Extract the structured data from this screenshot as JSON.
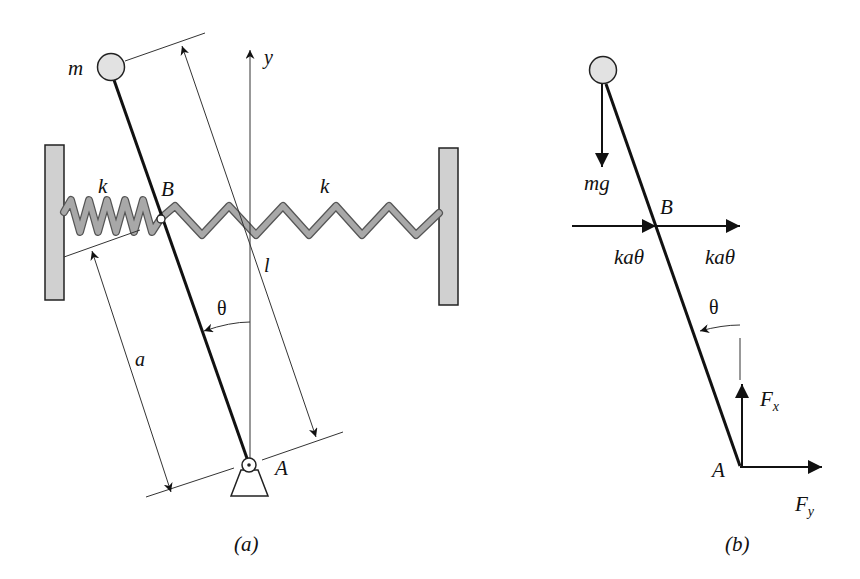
{
  "figure": {
    "panels": [
      {
        "id": "a",
        "caption": "(a)",
        "labels": {
          "mass": "m",
          "y_axis": "y",
          "spring_left": "k",
          "spring_right": "k",
          "point_B": "B",
          "point_A": "A",
          "length_l": "l",
          "length_a": "a",
          "angle": "θ"
        }
      },
      {
        "id": "b",
        "caption": "(b)",
        "labels": {
          "weight": "mg",
          "point_B": "B",
          "spring_force_left": "kaθ",
          "spring_force_right": "kaθ",
          "angle": "θ",
          "point_A": "A",
          "reaction_vertical": "F",
          "reaction_vertical_sub": "x",
          "reaction_horizontal": "F",
          "reaction_horizontal_sub": "y"
        }
      }
    ],
    "colors": {
      "line": "#111111",
      "wall_fill": "#d0d0d0",
      "spring_fill": "#a8a8a8",
      "mass_fill": "#e2e2e2"
    }
  }
}
